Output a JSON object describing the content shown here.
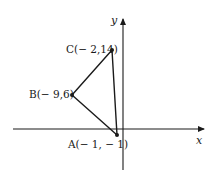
{
  "figure": {
    "type": "coordinate-plane-triangle",
    "axes": {
      "x_label": "x",
      "y_label": "y"
    },
    "points": [
      {
        "name": "A",
        "label": "A(− 1, − 1)",
        "x": -1,
        "y": -1
      },
      {
        "name": "B",
        "label": "B(− 9,6)",
        "x": -9,
        "y": 6
      },
      {
        "name": "C",
        "label": "C(− 2,14)",
        "x": -2,
        "y": 14
      }
    ],
    "segments": [
      "AB",
      "BC",
      "CA"
    ],
    "colors": {
      "line": "#1a1a1a",
      "background": "#ffffff"
    }
  }
}
